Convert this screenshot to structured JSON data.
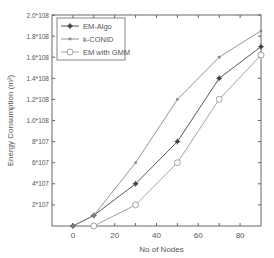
{
  "chart_data": {
    "type": "line",
    "title": "",
    "xlabel": "No of Nodes",
    "ylabel": "Energy Consumption (m²)",
    "xlim": [
      -10,
      90
    ],
    "ylim": [
      0,
      200000000
    ],
    "x_ticks": [
      0,
      20,
      40,
      60,
      80
    ],
    "x_tick_labels": [
      "0",
      "20",
      "40",
      "60",
      "80"
    ],
    "y_ticks": [
      20000000,
      40000000,
      60000000,
      80000000,
      100000000,
      120000000,
      140000000,
      160000000,
      180000000,
      200000000
    ],
    "y_tick_labels": [
      "2*10^7",
      "4*10^7",
      "6*10^7",
      "8*10^7",
      "1.0*10^8",
      "1.2*10^8",
      "1.4*10^8",
      "1.6*10^8",
      "1.8*10^8",
      "2.0*10^8"
    ],
    "grid": false,
    "legend_position": "upper left",
    "series": [
      {
        "name": "EM-Algo",
        "marker": "asterisk",
        "color": "#444444",
        "x": [
          0,
          10,
          30,
          50,
          70,
          90
        ],
        "values": [
          0,
          10000000,
          40000000,
          80000000,
          140000000,
          170000000
        ]
      },
      {
        "name": "k-CONID",
        "marker": "dot",
        "color": "#888888",
        "x": [
          0,
          10,
          30,
          50,
          70,
          90
        ],
        "values": [
          0,
          10000000,
          60000000,
          120000000,
          160000000,
          185000000
        ]
      },
      {
        "name": "EM with GMM",
        "marker": "circle",
        "color": "#999999",
        "x": [
          10,
          30,
          50,
          70,
          90
        ],
        "values": [
          0,
          20000000,
          60000000,
          120000000,
          162000000
        ]
      }
    ]
  }
}
